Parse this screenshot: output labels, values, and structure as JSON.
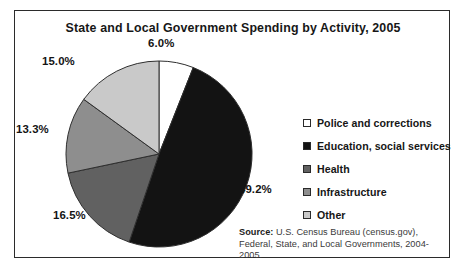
{
  "figure": {
    "title": "State and Local Government Spending by Activity, 2005",
    "source_label": "Source:",
    "source_text": " U.S. Census Bureau (census.gov), Federal, State, and Local Governments, 2004-2005."
  },
  "legend": {
    "items": [
      {
        "label": "Police and corrections",
        "swatch": "#ffffff"
      },
      {
        "label": "Education, social services",
        "swatch": "#131313"
      },
      {
        "label": "Health",
        "swatch": "#616161"
      },
      {
        "label": "Infrastructure",
        "swatch": "#8e8e8e"
      },
      {
        "label": "Other",
        "swatch": "#c9c9c9"
      }
    ]
  },
  "labels": {
    "police": "6.0%",
    "education": "49.2%",
    "health": "16.5%",
    "infrastructure": "13.3%",
    "other": "15.0%"
  },
  "chart_data": {
    "type": "pie",
    "title": "State and Local Government Spending by Activity, 2005",
    "xlabel": "",
    "ylabel": "",
    "legend_position": "right",
    "grid": false,
    "start_angle": 90,
    "direction": "clockwise",
    "units": "percent",
    "categories": [
      "Police and corrections",
      "Education, social services",
      "Health",
      "Infrastructure",
      "Other"
    ],
    "values": [
      6.0,
      49.2,
      16.5,
      13.3,
      15.0
    ],
    "data_labels": [
      "6.0%",
      "49.2%",
      "16.5%",
      "13.3%",
      "15.0%"
    ],
    "colors": [
      "#ffffff",
      "#131313",
      "#616161",
      "#8e8e8e",
      "#c9c9c9"
    ],
    "total": 100.0,
    "annotations": [
      "Source: U.S. Census Bureau (census.gov), Federal, State, and Local Governments, 2004-2005."
    ]
  }
}
